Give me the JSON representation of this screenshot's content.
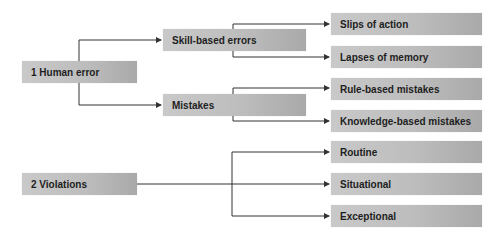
{
  "diagram": {
    "roots": [
      {
        "label": "1 Human error",
        "children": [
          {
            "label": "Skill-based errors",
            "children": [
              "Slips of action",
              "Lapses of memory"
            ]
          },
          {
            "label": "Mistakes",
            "children": [
              "Rule-based mistakes",
              "Knowledge-based mistakes"
            ]
          }
        ]
      },
      {
        "label": "2 Violations",
        "children": [
          "Routine",
          "Situational",
          "Exceptional"
        ]
      }
    ]
  },
  "nodes": {
    "human_error": "1 Human error",
    "skill_based": "Skill-based errors",
    "mistakes": "Mistakes",
    "slips": "Slips of action",
    "lapses": "Lapses of memory",
    "rule_based": "Rule-based mistakes",
    "knowledge_based": "Knowledge-based mistakes",
    "violations": "2 Violations",
    "routine": "Routine",
    "situational": "Situational",
    "exceptional": "Exceptional"
  },
  "colors": {
    "box_light": "#c9c9c9",
    "box_dark": "#a9a9a9",
    "line": "#333333",
    "text": "#1e1e1e"
  }
}
